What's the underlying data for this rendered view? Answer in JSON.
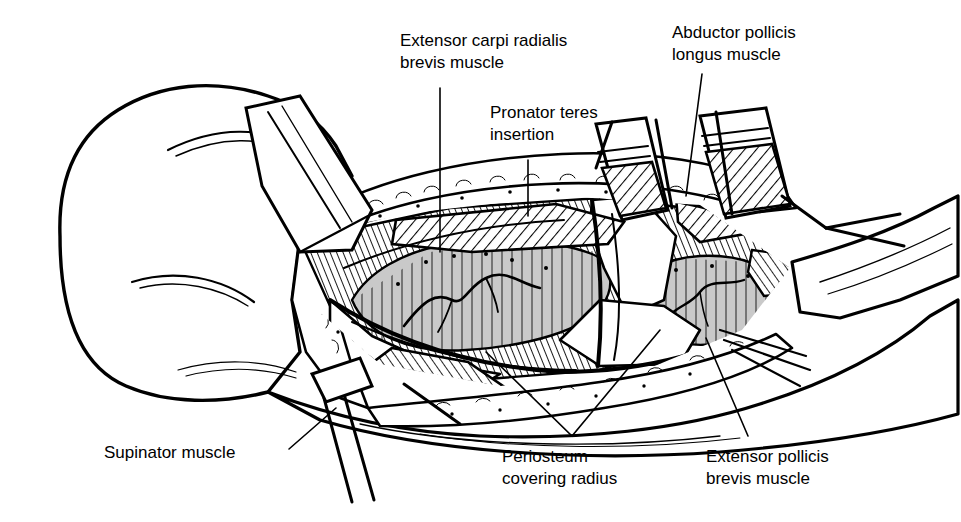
{
  "figure": {
    "style": "pen-and-ink line drawing",
    "background_color": "#ffffff",
    "ink_color": "#000000",
    "bone_fill_color": "#c9c9c9",
    "width": 961,
    "height": 522
  },
  "labels": [
    {
      "id": "extensor-carpi-radialis-brevis",
      "line1": "Extensor carpi radialis",
      "line2": "brevis muscle",
      "x": 400,
      "y": 46,
      "anchor": "start",
      "leader": "vertical",
      "leader_from": [
        440,
        88
      ],
      "leader_to": [
        440,
        252
      ]
    },
    {
      "id": "pronator-teres-insertion",
      "line1": "Pronator teres",
      "line2": "insertion",
      "x": 490,
      "y": 118,
      "anchor": "start",
      "leader": "vertical",
      "leader_from": [
        528,
        160
      ],
      "leader_to": [
        528,
        216
      ]
    },
    {
      "id": "abductor-pollicis-longus",
      "line1": "Abductor pollicis",
      "line2": "longus muscle",
      "x": 672,
      "y": 38,
      "anchor": "start",
      "leader": "diagonal",
      "leader_from": [
        702,
        74
      ],
      "leader_to": [
        686,
        196
      ]
    },
    {
      "id": "supinator-muscle",
      "line1": "Supinator muscle",
      "line2": "",
      "x": 104,
      "y": 458,
      "anchor": "start",
      "leader": "diagonal",
      "leader_from": [
        289,
        449
      ],
      "leader_to": [
        336,
        408
      ]
    },
    {
      "id": "periosteum-covering-radius",
      "line1": "Periosteum",
      "line2": "covering radius",
      "x": 502,
      "y": 462,
      "anchor": "start",
      "leader": "forked",
      "fork_apex": [
        572,
        436
      ],
      "fork_left_to": [
        486,
        352
      ],
      "fork_right_to": [
        660,
        330
      ]
    },
    {
      "id": "extensor-pollicis-brevis",
      "line1": "Extensor pollicis",
      "line2": "brevis muscle",
      "x": 706,
      "y": 462,
      "anchor": "start",
      "leader": "diagonal",
      "leader_from": [
        748,
        436
      ],
      "leader_to": [
        706,
        338
      ]
    }
  ],
  "anatomy_regions": [
    "upper arm and elbow skin contour",
    "retracted skin and fascia flaps",
    "exposed radius with periosteum",
    "cut muscle ends with cross hatching",
    "retractor blades"
  ]
}
